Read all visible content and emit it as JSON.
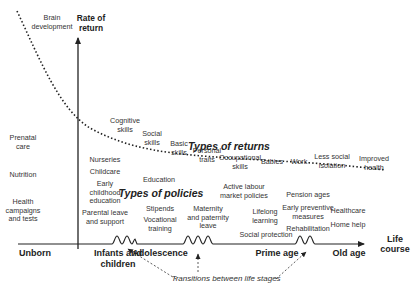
{
  "axes": {
    "y_label": "Rate of\nreturn",
    "x_label": "Life\ncourse"
  },
  "section_titles": {
    "returns": "Types of returns",
    "policies": "Types of policies"
  },
  "stages": [
    {
      "label": "Unborn",
      "x": 35
    },
    {
      "label": "Infants and\nchildren",
      "x": 118
    },
    {
      "label": "Adolescence",
      "x": 160
    },
    {
      "label": "Prime age",
      "x": 277
    },
    {
      "label": "Old age",
      "x": 349
    }
  ],
  "returns": [
    {
      "label": "Brain\ndevelopment",
      "x": 52,
      "y": 14
    },
    {
      "label": "Cognitive\nskills",
      "x": 125,
      "y": 117
    },
    {
      "label": "Social\nskills",
      "x": 152,
      "y": 130
    },
    {
      "label": "Basic\nskills",
      "x": 179,
      "y": 140
    },
    {
      "label": "Personal\ntraits",
      "x": 207,
      "y": 147
    },
    {
      "label": "Occupational\nskills",
      "x": 240,
      "y": 154
    },
    {
      "label": "Babies",
      "x": 272,
      "y": 158
    },
    {
      "label": "Work",
      "x": 299,
      "y": 158
    },
    {
      "label": "Less social\nisolation",
      "x": 332,
      "y": 153
    },
    {
      "label": "Improved\nhealth",
      "x": 374,
      "y": 155
    }
  ],
  "policies": [
    {
      "label": "Prenatal\ncare",
      "x": 23,
      "y": 134
    },
    {
      "label": "Nutrition",
      "x": 23,
      "y": 171
    },
    {
      "label": "Health\ncampaigns\nand tests",
      "x": 23,
      "y": 198
    },
    {
      "label": "Nurseries",
      "x": 105,
      "y": 156
    },
    {
      "label": "Childcare",
      "x": 105,
      "y": 168
    },
    {
      "label": "Early\nchildhood\neducation",
      "x": 105,
      "y": 180
    },
    {
      "label": "Parental leave\nand support",
      "x": 105,
      "y": 209
    },
    {
      "label": "Education",
      "x": 159,
      "y": 176
    },
    {
      "label": "Stipends",
      "x": 160,
      "y": 205
    },
    {
      "label": "Vocational\ntraining",
      "x": 160,
      "y": 216
    },
    {
      "label": "Maternity\nand paternity\nleave",
      "x": 208,
      "y": 205
    },
    {
      "label": "Active labour\nmarket policies",
      "x": 244,
      "y": 183
    },
    {
      "label": "Lifelong\nlearning",
      "x": 265,
      "y": 208
    },
    {
      "label": "Social protection",
      "x": 266,
      "y": 231
    },
    {
      "label": "Pension ages",
      "x": 308,
      "y": 191
    },
    {
      "label": "Early preventive\nmeasures",
      "x": 308,
      "y": 204
    },
    {
      "label": "Rehabilitation",
      "x": 308,
      "y": 225
    },
    {
      "label": "Healthcare",
      "x": 348,
      "y": 207
    },
    {
      "label": "Home help",
      "x": 348,
      "y": 221
    }
  ],
  "transitions_label": "Transitions between life stages"
}
